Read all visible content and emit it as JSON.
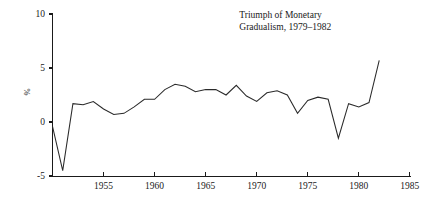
{
  "chart_data": {
    "type": "line",
    "title": "",
    "xlabel": "",
    "ylabel": "%",
    "xlim": [
      1950,
      1985
    ],
    "ylim": [
      -5,
      10
    ],
    "grid": false,
    "legend": "none",
    "xticks": [
      1955,
      1960,
      1965,
      1970,
      1975,
      1980,
      1985
    ],
    "xtick_labels": [
      "1955",
      "1960",
      "1965",
      "1970",
      "1975",
      "1980",
      "1985"
    ],
    "yticks": [
      -5,
      0,
      5,
      10
    ],
    "ytick_labels": [
      "-5",
      "0",
      "5",
      "10"
    ],
    "annotations": [
      {
        "name": "triumph-annotation",
        "lines": [
          "Triumph of Monetary",
          "Gradualism, 1979–1982"
        ],
        "x": 1968.3,
        "y": 9.6
      }
    ],
    "series": [
      {
        "name": "inflation-rate",
        "color": "#2a2a2a",
        "x": [
          1950,
          1951,
          1952,
          1953,
          1954,
          1955,
          1956,
          1957,
          1958,
          1959,
          1960,
          1961,
          1962,
          1963,
          1964,
          1965,
          1966,
          1967,
          1968,
          1969,
          1970,
          1971,
          1972,
          1973,
          1974,
          1975,
          1976,
          1977,
          1978,
          1979,
          1980,
          1981,
          1982
        ],
        "y": [
          -0.4,
          -4.5,
          1.7,
          1.6,
          1.9,
          1.2,
          0.7,
          0.8,
          1.4,
          2.1,
          2.1,
          3.0,
          3.5,
          3.3,
          2.8,
          3.0,
          3.0,
          2.5,
          3.4,
          2.4,
          1.9,
          2.7,
          2.9,
          2.5,
          0.8,
          2.0,
          2.3,
          2.1,
          -1.5,
          1.7,
          1.4,
          1.8,
          5.7
        ]
      }
    ]
  },
  "axis": {
    "y_title": "%"
  }
}
